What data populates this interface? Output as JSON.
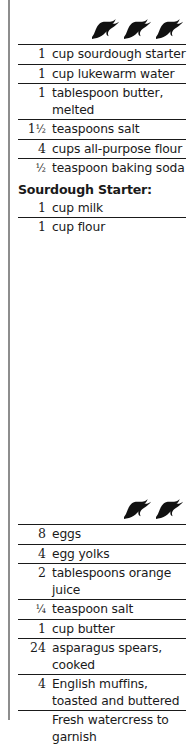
{
  "page": {
    "background_color": "#ffffff",
    "ink_color": "#1a1a1a",
    "gutter_rule_color": "#8d8d8d"
  },
  "recipes": [
    {
      "id": "sourdough-english-muffins",
      "ornament": {
        "icon": "flying-bird-icon",
        "count": 3
      },
      "ingredients": [
        {
          "qty": "1",
          "frac": "",
          "item": "cup sourdough starter"
        },
        {
          "qty": "1",
          "frac": "",
          "item": "cup lukewarm water"
        },
        {
          "qty": "1",
          "frac": "",
          "item": "tablespoon butter, melted"
        },
        {
          "qty": "1",
          "frac": "½",
          "item": "teaspoons salt"
        },
        {
          "qty": "4",
          "frac": "",
          "item": "cups all-purpose flour"
        },
        {
          "qty": "",
          "frac": "½",
          "item": "teaspoon baking soda"
        }
      ],
      "subsection": {
        "heading": "Sourdough Starter:",
        "ingredients": [
          {
            "qty": "1",
            "frac": "",
            "item": "cup milk"
          },
          {
            "qty": "1",
            "frac": "",
            "item": "cup flour"
          }
        ]
      }
    },
    {
      "id": "asparagus-eggs-on-muffins",
      "ornament": {
        "icon": "flying-bird-icon",
        "count": 2
      },
      "ingredients": [
        {
          "qty": "8",
          "frac": "",
          "item": "eggs"
        },
        {
          "qty": "4",
          "frac": "",
          "item": "egg yolks"
        },
        {
          "qty": "2",
          "frac": "",
          "item": "tablespoons orange juice"
        },
        {
          "qty": "",
          "frac": "¼",
          "item": "teaspoon salt"
        },
        {
          "qty": "1",
          "frac": "",
          "item": "cup butter"
        },
        {
          "qty": "24",
          "frac": "",
          "item": "asparagus spears, cooked"
        },
        {
          "qty": "4",
          "frac": "",
          "item": "English muffins, toasted and buttered"
        },
        {
          "qty": "",
          "frac": "",
          "item": "Fresh watercress to garnish"
        }
      ]
    }
  ]
}
